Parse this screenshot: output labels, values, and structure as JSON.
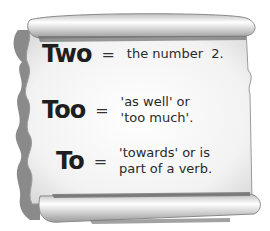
{
  "entries": [
    {
      "word": "Two",
      "equals": "=",
      "definition_lines": [
        "the number  2."
      ]
    },
    {
      "word": "Too",
      "equals": "=",
      "definition_lines": [
        "'as well' or",
        "'too much'."
      ]
    },
    {
      "word": "To",
      "equals": "=",
      "definition_lines": [
        "'towards' or is",
        "part of a verb."
      ]
    }
  ],
  "colors": {
    "paper": "#f4f4f4",
    "scroll_shadow": "#7a7a7a",
    "scroll_edge": "#a5a5a5",
    "text": "#1e1e1e"
  }
}
